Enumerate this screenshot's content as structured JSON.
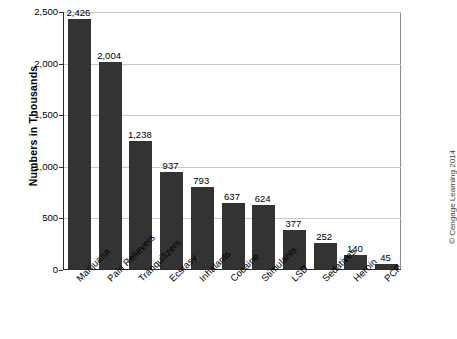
{
  "chart_data": {
    "type": "bar",
    "title": "",
    "xlabel": "",
    "ylabel": "Numbers in Thousands",
    "ylim": [
      0,
      2500
    ],
    "yticks": [
      0,
      500,
      1000,
      1500,
      2000,
      2500
    ],
    "ytick_labels": [
      "0",
      "500",
      "1,000",
      "1,500",
      "2,000",
      "2,500"
    ],
    "grid": true,
    "legend": null,
    "bar_color": "#333333",
    "categories": [
      "Marijuana",
      "Pain Relievers",
      "Tranquilizers",
      "Ecstasy",
      "Inhalants",
      "Cocaine",
      "Stimulants",
      "LSD",
      "Sedatives",
      "Heroin",
      "PCP"
    ],
    "values": [
      2426,
      2004,
      1238,
      937,
      793,
      637,
      624,
      377,
      252,
      140,
      45
    ],
    "value_labels": [
      "2,426",
      "2,004",
      "1,238",
      "937",
      "793",
      "637",
      "624",
      "377",
      "252",
      "140",
      "45"
    ]
  },
  "credit": "© Cengage Learning 2014"
}
